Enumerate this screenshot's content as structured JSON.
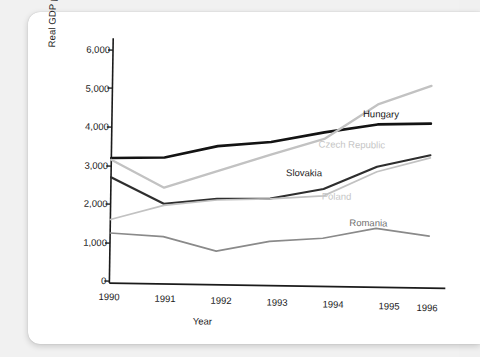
{
  "chart_data": {
    "type": "line",
    "title": "",
    "xlabel": "Year",
    "ylabel": "Real GDP per capita (U.S. dollars)",
    "x": [
      1990,
      1991,
      1992,
      1993,
      1994,
      1995,
      1996
    ],
    "xticklabels": [
      "1990",
      "1991",
      "1992",
      "1993",
      "1994",
      "1995",
      "1996"
    ],
    "yticklabels": [
      "0",
      "1,000",
      "2,000",
      "3,000",
      "4,000",
      "5,000",
      "6,000"
    ],
    "yticks": [
      0,
      1000,
      2000,
      3000,
      4000,
      5000,
      6000
    ],
    "ylim": [
      0,
      6200
    ],
    "xlim": [
      1990,
      1996
    ],
    "grid": false,
    "legend_position": "inline-labels",
    "series": [
      {
        "name": "Hungary",
        "color": "#131313",
        "width": 2.6,
        "values": [
          3200,
          3230,
          3550,
          3680,
          3950,
          4180,
          4220
        ]
      },
      {
        "name": "Czech Republic",
        "color": "#c2c2c2",
        "width": 2.3,
        "values": [
          3150,
          2450,
          2900,
          3350,
          3780,
          4700,
          5200
        ]
      },
      {
        "name": "Slovakia",
        "color": "#2e2e2e",
        "width": 2.2,
        "values": [
          2700,
          2030,
          2180,
          2210,
          2480,
          3080,
          3400
        ]
      },
      {
        "name": "Poland",
        "color": "#c2c2c2",
        "width": 1.7,
        "values": [
          1600,
          1990,
          2150,
          2200,
          2300,
          2950,
          3330
        ]
      },
      {
        "name": "Romania",
        "color": "#8a8a8a",
        "width": 1.7,
        "values": [
          1250,
          1180,
          820,
          1100,
          1200,
          1480,
          1300
        ]
      }
    ],
    "annotations": [
      {
        "text": "Hungary",
        "color": "#131313",
        "x": 362,
        "y": 106
      },
      {
        "text": "Czech Republic",
        "color": "#c6c6c6",
        "x": 318,
        "y": 137
      },
      {
        "text": "Slovakia",
        "color": "#1b1b1b",
        "x": 286,
        "y": 166
      },
      {
        "text": "Poland",
        "color": "#c6c6c6",
        "x": 322,
        "y": 189
      },
      {
        "text": "Romania",
        "color": "#6f6f6f",
        "x": 350,
        "y": 215
      }
    ]
  },
  "axes": {
    "y_label": "Real GDP per capita (U.S. dollars)",
    "x_label": "Year",
    "axis_color": "#1b1b1b"
  }
}
